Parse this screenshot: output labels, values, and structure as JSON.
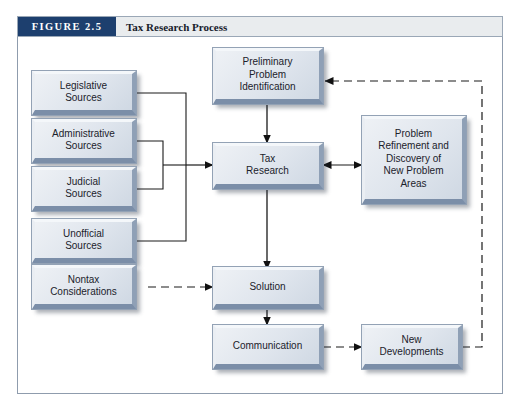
{
  "figure": {
    "badge": "FIGURE 2.5",
    "title": "Tax Research Process"
  },
  "colors": {
    "badge_background": "#1d3f6e",
    "badge_text": "#ffffff",
    "title_background": "#e9ecee",
    "title_text": "#17202b",
    "panel_border": "#8f9cad",
    "panel_background": "#ffffff",
    "node_face": "#dfe5ed",
    "node_highlight": "#f4f7fa",
    "node_shade": "#7b8ea8",
    "connector": "#1a1a1a"
  },
  "diagram": {
    "type": "flowchart",
    "nodes": [
      {
        "id": "legislative",
        "label": "Legislative\nSources"
      },
      {
        "id": "administrative",
        "label": "Administrative\nSources"
      },
      {
        "id": "judicial",
        "label": "Judicial\nSources"
      },
      {
        "id": "unofficial",
        "label": "Unofficial\nSources"
      },
      {
        "id": "nontax",
        "label": "Nontax\nConsiderations"
      },
      {
        "id": "preliminary",
        "label": "Preliminary\nProblem\nIdentification"
      },
      {
        "id": "tax_research",
        "label": "Tax\nResearch"
      },
      {
        "id": "solution",
        "label": "Solution"
      },
      {
        "id": "communication",
        "label": "Communication"
      },
      {
        "id": "refinement",
        "label": "Problem\nRefinement and\nDiscovery of\nNew Problem\nAreas"
      },
      {
        "id": "new_dev",
        "label": "New\nDevelopments"
      }
    ],
    "edges": [
      {
        "from": "legislative",
        "to": "tax_research",
        "style": "solid",
        "arrow": "single",
        "routing": "bracket"
      },
      {
        "from": "administrative",
        "to": "tax_research",
        "style": "solid",
        "arrow": "single",
        "routing": "bracket"
      },
      {
        "from": "judicial",
        "to": "tax_research",
        "style": "solid",
        "arrow": "single",
        "routing": "bracket"
      },
      {
        "from": "unofficial",
        "to": "tax_research",
        "style": "solid",
        "arrow": "single",
        "routing": "bracket"
      },
      {
        "from": "nontax",
        "to": "solution",
        "style": "dashed",
        "arrow": "single",
        "routing": "straight"
      },
      {
        "from": "preliminary",
        "to": "tax_research",
        "style": "solid",
        "arrow": "single",
        "routing": "straight"
      },
      {
        "from": "tax_research",
        "to": "solution",
        "style": "solid",
        "arrow": "single",
        "routing": "straight"
      },
      {
        "from": "solution",
        "to": "communication",
        "style": "solid",
        "arrow": "single",
        "routing": "straight"
      },
      {
        "from": "tax_research",
        "to": "refinement",
        "style": "solid",
        "arrow": "double",
        "routing": "straight"
      },
      {
        "from": "communication",
        "to": "new_dev",
        "style": "dashed",
        "arrow": "single",
        "routing": "straight"
      },
      {
        "from": "new_dev",
        "to": "preliminary",
        "style": "dashed",
        "arrow": "single",
        "routing": "orthogonal-right-top"
      }
    ]
  }
}
